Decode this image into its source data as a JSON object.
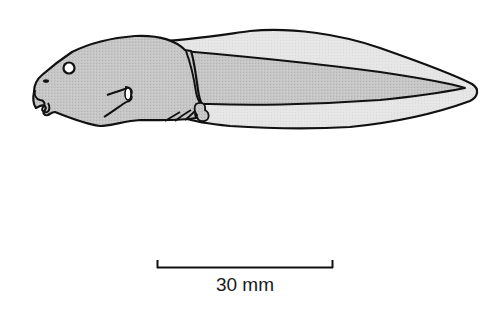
{
  "figure": {
    "view": "lateral",
    "colors": {
      "outline": "#111111",
      "body_fill": "#c4c4c4",
      "fin_fill": "#e4e4e4",
      "background": "#ffffff"
    }
  },
  "scale_bar": {
    "label": "30 mm",
    "value": 30,
    "unit": "mm"
  }
}
